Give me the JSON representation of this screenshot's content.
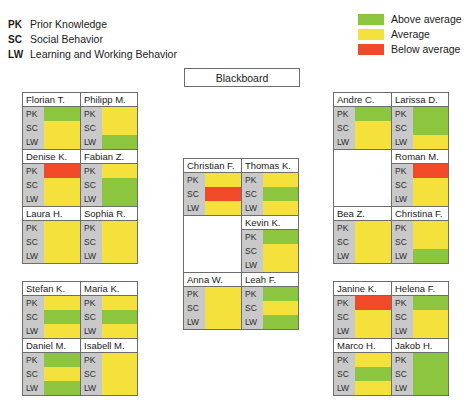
{
  "criteria_legend": [
    {
      "abbr": "PK",
      "label": "Prior Knowledge"
    },
    {
      "abbr": "SC",
      "label": "Social Behavior"
    },
    {
      "abbr": "LW",
      "label": "Learning and Working Behavior"
    }
  ],
  "color_legend": [
    {
      "label": "Above average",
      "color": "#8CC63E",
      "level": "above"
    },
    {
      "label": "Average",
      "color": "#F5E13C",
      "level": "average"
    },
    {
      "label": "Below average",
      "color": "#F04A28",
      "level": "below"
    }
  ],
  "colors": {
    "above": "#8CC63E",
    "average": "#F5E13C",
    "below": "#F04A28",
    "label_bg": "#C9C9C9",
    "border": "#6D6D6D",
    "empty": "#FFFFFF"
  },
  "blackboard": {
    "label": "Blackboard"
  },
  "bar_labels": [
    "PK",
    "SC",
    "LW"
  ],
  "groups": [
    {
      "id": "left-front",
      "rows": [
        {
          "seats": [
            {
              "name": "Florian T.",
              "ratings": [
                "above",
                "average",
                "average"
              ]
            },
            {
              "name": "Philipp M.",
              "ratings": [
                "average",
                "average",
                "above"
              ]
            }
          ]
        },
        {
          "seats": [
            {
              "name": "Denise K.",
              "ratings": [
                "below",
                "average",
                "average"
              ]
            },
            {
              "name": "Fabian Z.",
              "ratings": [
                "average",
                "above",
                "above"
              ]
            }
          ]
        },
        {
          "seats": [
            {
              "name": "Laura H.",
              "ratings": [
                "average",
                "average",
                "average"
              ]
            },
            {
              "name": "Sophia R.",
              "ratings": [
                "average",
                "average",
                "average"
              ]
            }
          ]
        }
      ]
    },
    {
      "id": "left-back",
      "rows": [
        {
          "seats": [
            {
              "name": "Stefan K.",
              "ratings": [
                "average",
                "above",
                "average"
              ]
            },
            {
              "name": "Maria K.",
              "ratings": [
                "average",
                "above",
                "average"
              ]
            }
          ]
        },
        {
          "seats": [
            {
              "name": "Daniel M.",
              "ratings": [
                "above",
                "average",
                "above"
              ]
            },
            {
              "name": "Isabell M.",
              "ratings": [
                "average",
                "average",
                "average"
              ]
            }
          ]
        }
      ]
    },
    {
      "id": "center",
      "rows": [
        {
          "seats": [
            {
              "name": "Christian F.",
              "ratings": [
                "average",
                "below",
                "average"
              ]
            },
            {
              "name": "Thomas K.",
              "ratings": [
                "average",
                "above",
                "average"
              ]
            }
          ]
        },
        {
          "seats": [
            {
              "name": "",
              "ratings": null,
              "empty": true
            },
            {
              "name": "Kevin K.",
              "ratings": [
                "above",
                "average",
                "average"
              ]
            }
          ]
        },
        {
          "seats": [
            {
              "name": "Anna W.",
              "ratings": [
                "average",
                "average",
                "average"
              ]
            },
            {
              "name": "Leah F.",
              "ratings": [
                "above",
                "average",
                "above"
              ]
            }
          ]
        }
      ]
    },
    {
      "id": "right-front",
      "rows": [
        {
          "seats": [
            {
              "name": "Andre C.",
              "ratings": [
                "above",
                "average",
                "average"
              ]
            },
            {
              "name": "Larissa D.",
              "ratings": [
                "above",
                "above",
                "average"
              ]
            }
          ]
        },
        {
          "seats": [
            {
              "name": "",
              "ratings": null,
              "empty": true
            },
            {
              "name": "Roman M.",
              "ratings": [
                "below",
                "average",
                "average"
              ]
            }
          ]
        },
        {
          "seats": [
            {
              "name": "Bea Z.",
              "ratings": [
                "average",
                "average",
                "average"
              ]
            },
            {
              "name": "Christina F.",
              "ratings": [
                "average",
                "average",
                "above"
              ]
            }
          ]
        }
      ]
    },
    {
      "id": "right-back",
      "rows": [
        {
          "seats": [
            {
              "name": "Janine K.",
              "ratings": [
                "below",
                "average",
                "average"
              ]
            },
            {
              "name": "Helena F.",
              "ratings": [
                "above",
                "average",
                "average"
              ]
            }
          ]
        },
        {
          "seats": [
            {
              "name": "Marco H.",
              "ratings": [
                "average",
                "above",
                "average"
              ]
            },
            {
              "name": "Jakob H.",
              "ratings": [
                "above",
                "above",
                "above"
              ]
            }
          ]
        }
      ]
    }
  ]
}
